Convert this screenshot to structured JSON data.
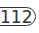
{
  "badge": {
    "value": "112",
    "border_color": "#333333",
    "text_color": "#333333",
    "background": "#ffffff"
  }
}
